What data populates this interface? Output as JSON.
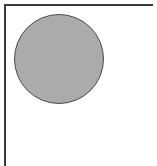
{
  "figure": {
    "background_color": "#ffffff",
    "frame": {
      "name": "open-corner-frame",
      "line_color": "#3a3a3a",
      "line_thickness_px": 2,
      "sides_drawn": [
        "top",
        "left"
      ],
      "sides_omitted": [
        "right",
        "bottom"
      ],
      "top_rule": {
        "x": 4,
        "y": 4,
        "length_px": 149
      },
      "left_rule": {
        "x": 4,
        "y": 4,
        "length_px": 162
      }
    },
    "shapes": [
      {
        "name": "gray-circle",
        "type": "circle",
        "fill_color": "#ababab",
        "stroke_color": "#4a4a4a",
        "stroke_width_px": 1,
        "center_x": 59,
        "center_y": 59,
        "diameter_px": 90,
        "radius_px": 45
      }
    ],
    "labels": [],
    "canvas": {
      "width": 157,
      "height": 166
    }
  }
}
